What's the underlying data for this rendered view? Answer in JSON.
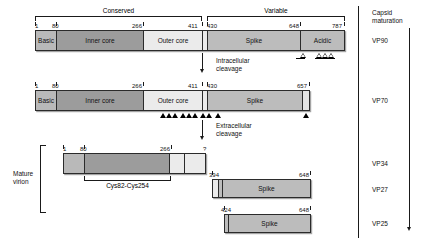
{
  "diagram": {
    "domain_brackets": [
      {
        "id": "conserved",
        "label": "Conserved"
      },
      {
        "id": "variable",
        "label": "Variable"
      }
    ],
    "right_column": {
      "heading_line1": "Capsid",
      "heading_line2": "maturation",
      "stages": [
        {
          "name": "vp90",
          "label": "VP90"
        },
        {
          "name": "vp70",
          "label": "VP70"
        },
        {
          "name": "vp34",
          "label": "VP34"
        },
        {
          "name": "vp27",
          "label": "VP27"
        },
        {
          "name": "vp25",
          "label": "VP25"
        }
      ]
    },
    "cleavage_annotations": [
      {
        "id": "intracellular",
        "line1": "Intracellular",
        "line2": "cleavage"
      },
      {
        "id": "extracellular",
        "line1": "Extracellular",
        "line2": "cleavage"
      }
    ],
    "mature_virion": {
      "line1": "Mature",
      "line2": "virion"
    },
    "disulfide": {
      "label": "Cys82-Cys254"
    },
    "rows": [
      {
        "name": "vp90",
        "stage": "VP90",
        "coordinates": [
          "1",
          "80",
          "266",
          "411",
          "430",
          "648",
          "787"
        ],
        "segments": [
          {
            "name": "basic",
            "label": "Basic"
          },
          {
            "name": "inner-core",
            "label": "Inner core"
          },
          {
            "name": "outer-core",
            "label": "Outer core"
          },
          {
            "name": "linker",
            "label": ""
          },
          {
            "name": "spike",
            "label": "Spike"
          },
          {
            "name": "acidic",
            "label": "Acidic"
          }
        ]
      },
      {
        "name": "vp70",
        "stage": "VP70",
        "coordinates": [
          "1",
          "80",
          "266",
          "411",
          "430",
          "657"
        ],
        "segments": [
          {
            "name": "basic",
            "label": "Basic"
          },
          {
            "name": "inner-core",
            "label": "Inner core"
          },
          {
            "name": "outer-core",
            "label": "Outer core"
          },
          {
            "name": "linker",
            "label": ""
          },
          {
            "name": "spike",
            "label": "Spike"
          },
          {
            "name": "tail",
            "label": ""
          }
        ]
      },
      {
        "name": "vp34",
        "stage": "VP34",
        "coordinates": [
          "1",
          "80",
          "266",
          "?"
        ],
        "segments": [
          {
            "name": "basic",
            "label": ""
          },
          {
            "name": "inner-core",
            "label": ""
          },
          {
            "name": "outer-core-part1",
            "label": ""
          },
          {
            "name": "outer-core-part2",
            "label": ""
          }
        ]
      },
      {
        "name": "vp27",
        "stage": "VP27",
        "coordinates": [
          "394",
          "648"
        ],
        "segments": [
          {
            "name": "n-terminal",
            "label": ""
          },
          {
            "name": "divider",
            "label": ""
          },
          {
            "name": "spike",
            "label": "Spike"
          }
        ]
      },
      {
        "name": "vp25",
        "stage": "VP25",
        "coordinates": [
          "424",
          "648"
        ],
        "segments": [
          {
            "name": "n-terminal",
            "label": ""
          },
          {
            "name": "spike",
            "label": "Spike"
          }
        ]
      }
    ],
    "colors": {
      "basic": "#b9b9b9",
      "inner_core": "#9c9c9c",
      "outer_core": "#ebebeb",
      "spike": "#bcbcbc",
      "acidic": "#bcbcbc",
      "outline": "#2b2b2b",
      "text": "#111111"
    }
  }
}
